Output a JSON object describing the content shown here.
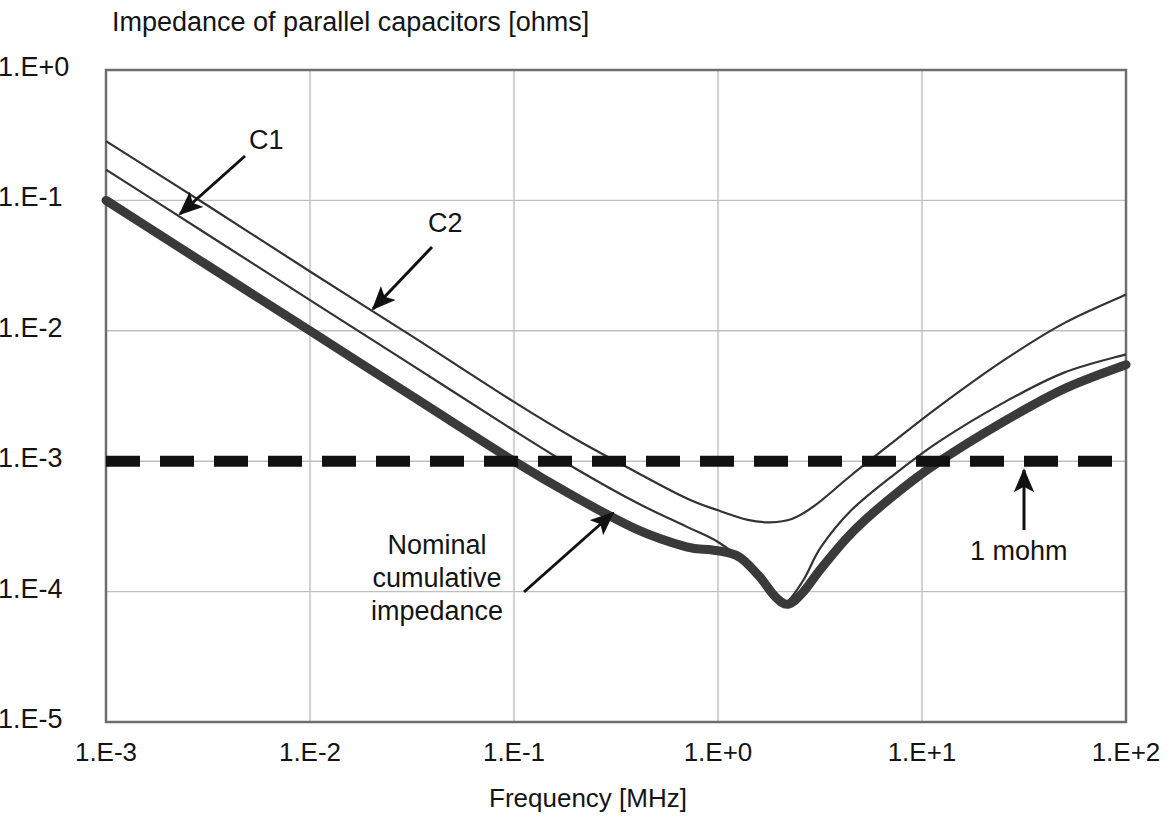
{
  "chart_data": {
    "type": "line",
    "title": "Impedance of parallel capacitors [ohms]",
    "xlabel": "Frequency [MHz]",
    "ylabel": "",
    "xscale": "log",
    "yscale": "log",
    "xlim": [
      0.001,
      100
    ],
    "ylim": [
      1e-05,
      1
    ],
    "xticklabels": [
      "1.E-3",
      "1.E-2",
      "1.E-1",
      "1.E+0",
      "1.E+1",
      "1.E+2"
    ],
    "xtickvalues": [
      0.001,
      0.01,
      0.1,
      1,
      10,
      100
    ],
    "yticklabels": [
      "1.E+0",
      "1.E-1",
      "1.E-2",
      "1.E-3",
      "1.E-4",
      "1.E-5"
    ],
    "ytickvalues": [
      1,
      0.1,
      0.01,
      0.001,
      0.0001,
      1e-05
    ],
    "grid": true,
    "legend": "none",
    "annotations": [
      {
        "name": "c1",
        "text": "C1",
        "points_to": "thin capacitor C1 curve"
      },
      {
        "name": "c2",
        "text": "C2",
        "points_to": "thin capacitor C2 curve"
      },
      {
        "name": "nominal",
        "text": "Nominal\ncumulative\nimpedance",
        "points_to": "thick cumulative impedance curve"
      },
      {
        "name": "mohm",
        "text": "1 mohm",
        "points_to": "dashed 1 milliohm target line"
      }
    ],
    "series": [
      {
        "name": "C1",
        "style": "thin-solid",
        "color": "#333333",
        "points": [
          [
            0.001,
            0.172
          ],
          [
            0.00316,
            0.0545
          ],
          [
            0.01,
            0.0172
          ],
          [
            0.0316,
            0.00545
          ],
          [
            0.1,
            0.00172
          ],
          [
            0.2,
            0.00088
          ],
          [
            0.4,
            0.00048
          ],
          [
            0.7,
            0.000315
          ],
          [
            1.0,
            0.00024
          ],
          [
            1.4,
            0.00016
          ],
          [
            1.8,
            0.0001
          ],
          [
            2.1,
            8e-05
          ],
          [
            2.6,
            0.00012
          ],
          [
            3.2,
            0.00022
          ],
          [
            4.5,
            0.00042
          ],
          [
            7.0,
            0.00075
          ],
          [
            12.0,
            0.0014
          ],
          [
            25.0,
            0.0028
          ],
          [
            50.0,
            0.0048
          ],
          [
            100.0,
            0.0066
          ]
        ]
      },
      {
        "name": "C2",
        "style": "thin-solid",
        "color": "#333333",
        "points": [
          [
            0.001,
            0.285
          ],
          [
            0.00316,
            0.091
          ],
          [
            0.01,
            0.0285
          ],
          [
            0.0316,
            0.0091
          ],
          [
            0.1,
            0.00285
          ],
          [
            0.2,
            0.00148
          ],
          [
            0.4,
            0.00082
          ],
          [
            0.7,
            0.00052
          ],
          [
            1.0,
            0.00042
          ],
          [
            1.4,
            0.000355
          ],
          [
            1.8,
            0.00034
          ],
          [
            2.3,
            0.00036
          ],
          [
            3.0,
            0.00046
          ],
          [
            4.5,
            0.00078
          ],
          [
            7.0,
            0.00135
          ],
          [
            12.0,
            0.0026
          ],
          [
            25.0,
            0.0059
          ],
          [
            50.0,
            0.0115
          ],
          [
            100.0,
            0.019
          ]
        ]
      },
      {
        "name": "Nominal cumulative impedance",
        "style": "thick-solid",
        "color": "#3a3a3a",
        "points": [
          [
            0.001,
            0.1
          ],
          [
            0.00316,
            0.0316
          ],
          [
            0.01,
            0.01
          ],
          [
            0.0316,
            0.00316
          ],
          [
            0.1,
            0.001
          ],
          [
            0.2,
            0.00053
          ],
          [
            0.4,
            0.0003
          ],
          [
            0.7,
            0.00022
          ],
          [
            0.9,
            0.00021
          ],
          [
            1.1,
            0.0002
          ],
          [
            1.3,
            0.00018
          ],
          [
            1.6,
            0.00013
          ],
          [
            1.9,
            9.2e-05
          ],
          [
            2.2,
            8e-05
          ],
          [
            2.6,
            9.8e-05
          ],
          [
            3.2,
            0.00015
          ],
          [
            4.5,
            0.00028
          ],
          [
            7.0,
            0.00052
          ],
          [
            12.0,
            0.00098
          ],
          [
            25.0,
            0.002
          ],
          [
            50.0,
            0.0036
          ],
          [
            100.0,
            0.0055
          ]
        ]
      },
      {
        "name": "1 mohm",
        "style": "thick-dashed",
        "color": "#111111",
        "constant_y": 0.001,
        "points": [
          [
            0.001,
            0.001
          ],
          [
            100.0,
            0.001
          ]
        ]
      }
    ]
  },
  "annotations": {
    "c1": "C1",
    "c2": "C2",
    "nominal": "Nominal\ncumulative\nimpedance",
    "mohm": "1 mohm"
  }
}
